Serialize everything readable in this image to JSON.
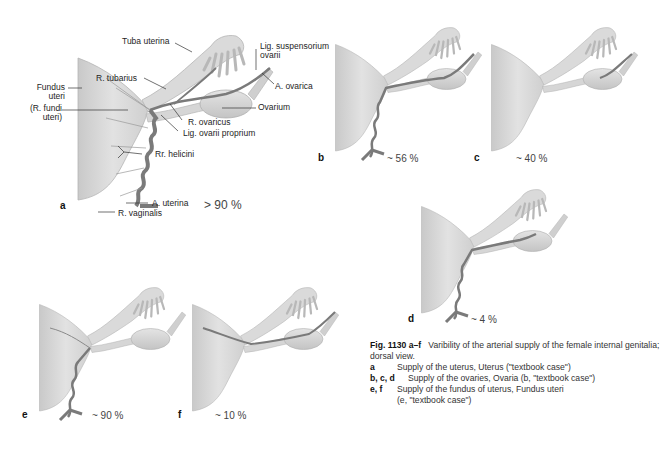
{
  "figure": {
    "panels": {
      "a": {
        "letter": "a",
        "percentage": "> 90 %",
        "labels": {
          "tuba_uterina": "Tuba uterina",
          "lig_suspensorium_1": "Lig. suspensorium",
          "lig_suspensorium_2": "ovarii",
          "a_ovarica": "A. ovarica",
          "fundus_1": "Fundus",
          "fundus_2": "uteri",
          "r_tubarius": "R. tubarius",
          "r_fundi_1": "(R. fundi",
          "r_fundi_2": "uteri)",
          "ovarium": "Ovarium",
          "r_ovaricus": "R. ovaricus",
          "lig_ovarii_proprium": "Lig. ovarii proprium",
          "rr_helicini": "Rr. helicini",
          "a_uterina": "A. uterina",
          "r_vaginalis": "R. vaginalis"
        }
      },
      "b": {
        "letter": "b",
        "percentage": "~ 56 %"
      },
      "c": {
        "letter": "c",
        "percentage": "~ 40 %"
      },
      "d": {
        "letter": "d",
        "percentage": "~ 4 %"
      },
      "e": {
        "letter": "e",
        "percentage": "~ 90 %"
      },
      "f": {
        "letter": "f",
        "percentage": "~ 10 %"
      }
    },
    "caption": {
      "fig_number": "Fig. 1130 a–f",
      "title": "Varibility of the arterial supply of the female internal genitalia;",
      "subtitle": "dorsal view.",
      "items": [
        {
          "key": "a",
          "text": "Supply of the uterus, Uterus (\"textbook case\")"
        },
        {
          "key": "b, c, d",
          "text": "Supply of the ovaries, Ovaria (b, \"textbook case\")"
        },
        {
          "key": "e, f",
          "text": "Supply of the fundus of uterus, Fundus uteri"
        },
        {
          "key": "",
          "text": "(e, \"textbook case\")"
        }
      ]
    },
    "colors": {
      "tissue": "#d9d9d9",
      "tissue_shadow": "#b8b8b8",
      "artery": "#7a7a7a",
      "leader_line": "#333333"
    }
  }
}
